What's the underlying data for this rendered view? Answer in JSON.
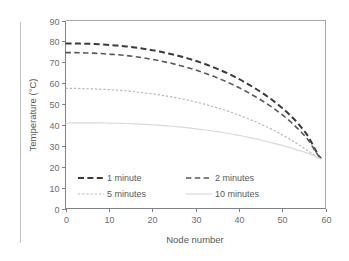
{
  "chart_data": {
    "type": "line",
    "title": "",
    "xlabel": "Node number",
    "ylabel": "Temperature (°C)",
    "xlim": [
      0,
      60
    ],
    "ylim": [
      0,
      90
    ],
    "xticks": [
      0,
      10,
      20,
      30,
      40,
      50,
      60
    ],
    "yticks": [
      0,
      10,
      20,
      30,
      40,
      50,
      60,
      70,
      80,
      90
    ],
    "grid": false,
    "legend_position": "inside-lower-left",
    "x": [
      0,
      2,
      4,
      6,
      8,
      10,
      12,
      14,
      16,
      18,
      20,
      22,
      24,
      26,
      28,
      30,
      32,
      34,
      36,
      38,
      40,
      42,
      44,
      46,
      48,
      50,
      52,
      54,
      56,
      58,
      59
    ],
    "series": [
      {
        "name": "1 minute",
        "color": "#3b3b3d",
        "style": "dashed",
        "width": 2.0,
        "dash": "6,3.4",
        "values": [
          79.0,
          79.0,
          78.9,
          78.8,
          78.6,
          78.3,
          78.0,
          77.6,
          77.1,
          76.5,
          75.8,
          75.0,
          74.1,
          73.1,
          72.0,
          70.7,
          69.3,
          67.7,
          66.0,
          64.1,
          62.0,
          59.7,
          57.2,
          54.5,
          51.5,
          48.1,
          44.3,
          39.9,
          34.5,
          26.8,
          23.8
        ]
      },
      {
        "name": "2 minutes",
        "color": "#59595b",
        "style": "dashed",
        "width": 1.6,
        "dash": "5.4,3.4",
        "values": [
          74.6,
          74.6,
          74.5,
          74.4,
          74.2,
          73.9,
          73.6,
          73.2,
          72.7,
          72.1,
          71.4,
          70.6,
          69.7,
          68.7,
          67.6,
          66.3,
          64.9,
          63.4,
          61.7,
          59.9,
          57.9,
          55.7,
          53.3,
          50.8,
          48.0,
          44.9,
          41.4,
          37.4,
          32.8,
          26.3,
          23.8
        ]
      },
      {
        "name": "5 minutes",
        "color": "#b6b8ba",
        "style": "dotted",
        "width": 1.2,
        "dash": "2.3,1.9",
        "values": [
          57.5,
          57.5,
          57.4,
          57.3,
          57.1,
          56.9,
          56.6,
          56.3,
          55.9,
          55.4,
          54.9,
          54.3,
          53.6,
          52.8,
          52.0,
          51.0,
          50.0,
          48.8,
          47.6,
          46.2,
          44.7,
          43.1,
          41.4,
          39.5,
          37.5,
          35.3,
          32.9,
          30.3,
          27.6,
          24.6,
          23.8
        ]
      },
      {
        "name": "10 minutes",
        "color": "#d8d9da",
        "style": "solid",
        "width": 1.2,
        "dash": "",
        "values": [
          40.9,
          41.0,
          41.0,
          41.0,
          41.0,
          40.9,
          40.8,
          40.7,
          40.5,
          40.3,
          40.1,
          39.8,
          39.5,
          39.1,
          38.7,
          38.2,
          37.7,
          37.1,
          36.5,
          35.8,
          35.0,
          34.2,
          33.3,
          32.3,
          31.3,
          30.2,
          29.0,
          27.7,
          26.4,
          24.6,
          23.8
        ]
      }
    ]
  },
  "legend": {
    "entries": [
      {
        "label": "1 minute"
      },
      {
        "label": "2 minutes"
      },
      {
        "label": "5 minutes"
      },
      {
        "label": "10 minutes"
      }
    ]
  }
}
